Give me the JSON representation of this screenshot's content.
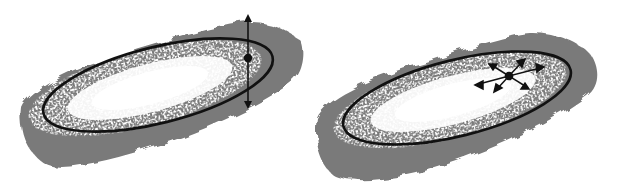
{
  "diagram": {
    "background": "#ffffff",
    "colors": {
      "blob_gray": "#7a7a7a",
      "speckle_white": "#ffffff",
      "ellipse_stroke": "#111111",
      "handle": "#111111"
    },
    "panels": [
      {
        "id": "left",
        "description": "Ellipse fitted to speckled gray distribution with a vertical two-headed arrow through a control point",
        "handle_type": "vertical-double-arrow"
      },
      {
        "id": "right",
        "description": "Ellipse fitted to speckled gray distribution with a multi-directional (six-way) arrow handle at a control point",
        "handle_type": "multi-direction-arrows"
      }
    ]
  }
}
